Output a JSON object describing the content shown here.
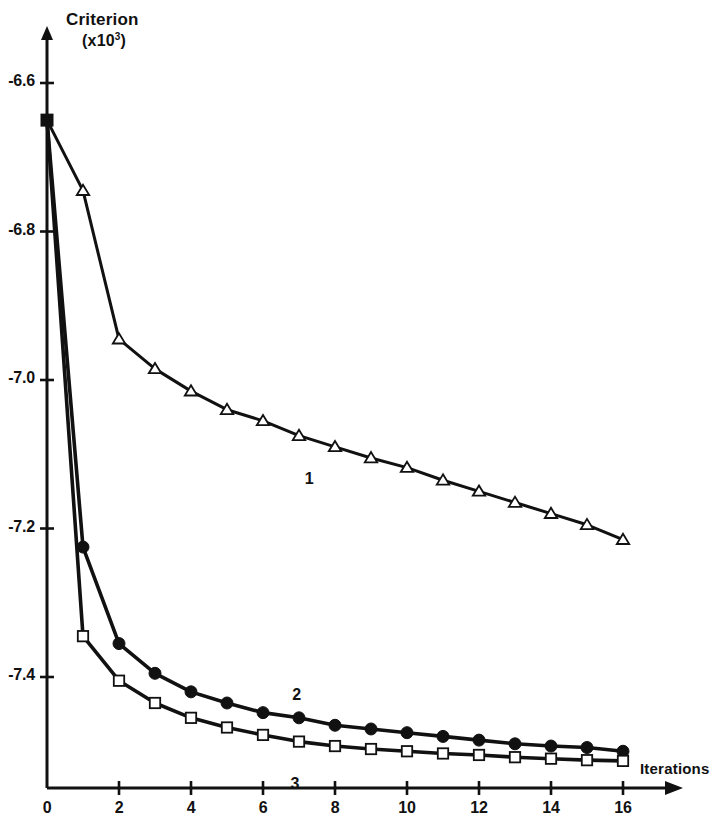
{
  "chart_data": {
    "type": "line",
    "title": "",
    "ylabel": "Criterion",
    "ylabel_unit": "(x10",
    "ylabel_unit_exp": "3",
    "ylabel_unit_close": ")",
    "xlabel": "Iterations",
    "xlim": [
      0,
      17.2
    ],
    "ylim": [
      -7.56,
      -6.52
    ],
    "grid": false,
    "legend_position": "inline-annotations",
    "xticks": [
      0,
      2,
      4,
      6,
      8,
      10,
      12,
      14,
      16
    ],
    "xtick_labels": [
      "0",
      "2",
      "4",
      "6",
      "8",
      "10",
      "12",
      "14",
      "16"
    ],
    "yticks": [
      -6.6,
      -6.8,
      -7.0,
      -7.2,
      -7.4
    ],
    "ytick_labels": [
      "-6.6",
      "-6.8",
      "-7.0",
      "-7.2",
      "-7.4"
    ],
    "x": [
      0,
      1,
      2,
      3,
      4,
      5,
      6,
      7,
      8,
      9,
      10,
      11,
      12,
      13,
      14,
      15,
      16
    ],
    "series": [
      {
        "name": "1",
        "marker": "open-triangle",
        "color": "#111111",
        "label_x": 7.3,
        "label_y": -7.135,
        "values": [
          -6.65,
          -6.745,
          -6.945,
          -6.985,
          -7.015,
          -7.04,
          -7.055,
          -7.075,
          -7.09,
          -7.105,
          -7.118,
          -7.135,
          -7.15,
          -7.165,
          -7.18,
          -7.195,
          -7.215
        ]
      },
      {
        "name": "2",
        "marker": "filled-circle",
        "color": "#111111",
        "label_x": 6.95,
        "label_y": -7.425,
        "values": [
          -6.65,
          -7.225,
          -7.355,
          -7.395,
          -7.42,
          -7.435,
          -7.448,
          -7.455,
          -7.465,
          -7.47,
          -7.475,
          -7.48,
          -7.485,
          -7.49,
          -7.493,
          -7.495,
          -7.5
        ]
      },
      {
        "name": "3",
        "marker": "open-square",
        "color": "#111111",
        "label_x": 6.9,
        "label_y": -7.545,
        "values": [
          -6.65,
          -7.345,
          -7.405,
          -7.435,
          -7.455,
          -7.468,
          -7.478,
          -7.487,
          -7.493,
          -7.497,
          -7.5,
          -7.503,
          -7.505,
          -7.508,
          -7.51,
          -7.512,
          -7.513
        ]
      }
    ],
    "origin_marker": {
      "name": "common-start-point",
      "marker": "filled-square",
      "x": 0,
      "y": -6.65
    }
  }
}
